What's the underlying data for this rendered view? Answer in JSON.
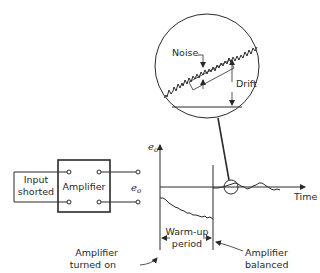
{
  "figure": {
    "type": "amplifier drift and noise diagram"
  },
  "circuit": {
    "input_label_line1": "Input",
    "input_label_line2": "shorted",
    "amplifier_label": "Amplifier",
    "output_label": "e",
    "output_label_sub": "o"
  },
  "plot": {
    "y_axis_label": "e",
    "y_axis_label_sub": "o",
    "x_axis_label": "Time",
    "warmup_label_line1": "Warm-up",
    "warmup_label_line2": "period",
    "turned_on_label_line1": "Amplifier",
    "turned_on_label_line2": "turned on",
    "balanced_label_line1": "Amplifier",
    "balanced_label_line2": "balanced"
  },
  "magnifier": {
    "noise_label": "Noise",
    "drift_label": "Drift"
  }
}
